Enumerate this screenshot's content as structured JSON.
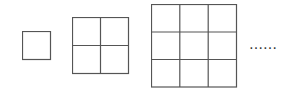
{
  "diagram": {
    "stroke_color": "#555555",
    "figures": [
      {
        "n": 1,
        "rows": 1,
        "cols": 1,
        "x": 22,
        "y": 31,
        "size": 29
      },
      {
        "n": 2,
        "rows": 2,
        "cols": 2,
        "x": 72,
        "y": 17,
        "size": 57
      },
      {
        "n": 3,
        "rows": 3,
        "cols": 3,
        "x": 151,
        "y": 4,
        "size": 86
      }
    ],
    "continuation": "……"
  }
}
